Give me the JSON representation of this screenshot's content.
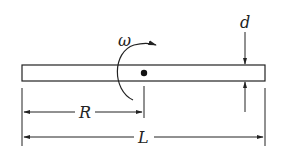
{
  "diagram": {
    "labels": {
      "omega": "ω",
      "d": "d",
      "R": "R",
      "L": "L"
    },
    "colors": {
      "stroke": "#222222",
      "background": "#ffffff"
    },
    "elements": [
      {
        "id": "rod",
        "type": "rectangle",
        "description": "thin rod of length L and thickness d"
      },
      {
        "id": "pivot",
        "type": "dot",
        "description": "pivot point at distance R from left end"
      },
      {
        "id": "rotation-arrow",
        "type": "curved-arrow",
        "label": "ω",
        "description": "angular velocity clockwise"
      },
      {
        "id": "dimension-R",
        "type": "dimension-line",
        "label": "R"
      },
      {
        "id": "dimension-L",
        "type": "dimension-line",
        "label": "L"
      },
      {
        "id": "dimension-d",
        "type": "thickness-arrows",
        "label": "d"
      }
    ]
  }
}
